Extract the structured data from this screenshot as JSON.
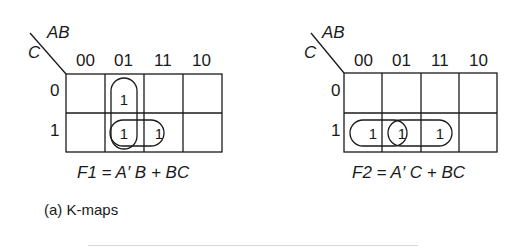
{
  "kmaps": [
    {
      "id": "F1",
      "row_var": "C",
      "col_var": "AB",
      "col_headers": [
        "00",
        "01",
        "11",
        "10"
      ],
      "row_headers": [
        "0",
        "1"
      ],
      "cells": [
        [
          "",
          "1",
          "",
          ""
        ],
        [
          "",
          "1",
          "1",
          ""
        ]
      ],
      "groups": [
        "vertical 01 column (rows 0-1)",
        "horizontal row 1 (cols 01-11)"
      ],
      "equation": "F1 = A′ B + BC"
    },
    {
      "id": "F2",
      "row_var": "C",
      "col_var": "AB",
      "col_headers": [
        "00",
        "01",
        "11",
        "10"
      ],
      "row_headers": [
        "0",
        "1"
      ],
      "cells": [
        [
          "",
          "",
          "",
          ""
        ],
        [
          "1",
          "1",
          "1",
          ""
        ]
      ],
      "groups": [
        "horizontal row 1 (cols 00-01)",
        "horizontal row 1 (cols 01-11)"
      ],
      "equation": "F2 = A′ C +  BC"
    }
  ],
  "caption": "(a) K-maps",
  "colors": {
    "line": "#1a1a1a",
    "rule": "#d6d6d6",
    "background": "#ffffff"
  }
}
